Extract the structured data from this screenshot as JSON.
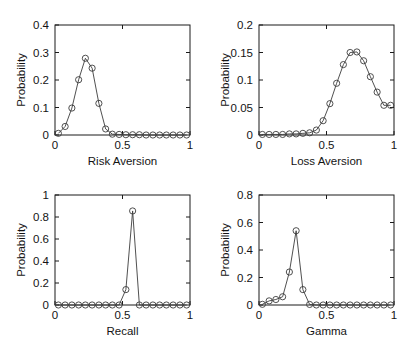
{
  "figure": {
    "layout": "2x2 grid of probability distribution subplots",
    "background_color": "#ffffff",
    "line_color": "#3c3c3c",
    "marker_color": "#3c3c3c",
    "axis_color": "#1a1a1a"
  },
  "chart_data": [
    {
      "id": "risk-aversion",
      "type": "line",
      "title": "",
      "xlabel": "Risk Aversion",
      "ylabel": "Probability",
      "xlim": [
        0,
        1
      ],
      "ylim": [
        0,
        0.4
      ],
      "xticks": [
        0,
        0.5,
        1
      ],
      "xticklabels": [
        "0",
        "0.5",
        "1"
      ],
      "yticks": [
        0,
        0.1,
        0.2,
        0.3,
        0.4
      ],
      "yticklabels": [
        "0",
        "0.1",
        "0.2",
        "0.3",
        "0.4"
      ],
      "grid": false,
      "legend": "none",
      "marker": "open-circle",
      "x": [
        0.025,
        0.075,
        0.125,
        0.175,
        0.225,
        0.275,
        0.325,
        0.375,
        0.425,
        0.475,
        0.525,
        0.575,
        0.625,
        0.675,
        0.725,
        0.775,
        0.825,
        0.875,
        0.925,
        0.975
      ],
      "values": [
        0.006,
        0.031,
        0.098,
        0.201,
        0.279,
        0.243,
        0.115,
        0.022,
        0.003,
        0.002,
        0.001,
        0.001,
        0.001,
        0.0,
        0.0,
        0.0,
        0.0,
        0.0,
        0.0,
        0.0
      ]
    },
    {
      "id": "loss-aversion",
      "type": "line",
      "title": "",
      "xlabel": "Loss Aversion",
      "ylabel": "Probability",
      "xlim": [
        0,
        1
      ],
      "ylim": [
        0,
        0.2
      ],
      "xticks": [
        0,
        0.5,
        1
      ],
      "xticklabels": [
        "0",
        "0.5",
        "1"
      ],
      "yticks": [
        0,
        0.05,
        0.1,
        0.15,
        0.2
      ],
      "yticklabels": [
        "0",
        "0.05",
        "0.1",
        "0.15",
        "0.2"
      ],
      "grid": false,
      "legend": "none",
      "marker": "open-circle",
      "x": [
        0.025,
        0.075,
        0.125,
        0.175,
        0.225,
        0.275,
        0.325,
        0.375,
        0.425,
        0.475,
        0.525,
        0.575,
        0.625,
        0.675,
        0.725,
        0.775,
        0.825,
        0.875,
        0.925,
        0.975
      ],
      "values": [
        0.001,
        0.001,
        0.001,
        0.001,
        0.002,
        0.002,
        0.003,
        0.004,
        0.009,
        0.026,
        0.057,
        0.094,
        0.128,
        0.15,
        0.151,
        0.135,
        0.106,
        0.078,
        0.054,
        0.054
      ]
    },
    {
      "id": "recall",
      "type": "line",
      "title": "",
      "xlabel": "Recall",
      "ylabel": "Probability",
      "xlim": [
        0,
        1
      ],
      "ylim": [
        0,
        1
      ],
      "xticks": [
        0,
        0.5,
        1
      ],
      "xticklabels": [
        "0",
        "0.5",
        "1"
      ],
      "yticks": [
        0,
        0.2,
        0.4,
        0.6,
        0.8,
        1
      ],
      "yticklabels": [
        "0",
        "0.2",
        "0.4",
        "0.6",
        "0.8",
        "1"
      ],
      "grid": false,
      "legend": "none",
      "marker": "open-circle",
      "x": [
        0.025,
        0.075,
        0.125,
        0.175,
        0.225,
        0.275,
        0.325,
        0.375,
        0.425,
        0.475,
        0.525,
        0.575,
        0.625,
        0.675,
        0.725,
        0.775,
        0.825,
        0.875,
        0.925,
        0.975
      ],
      "values": [
        0.0,
        0.0,
        0.0,
        0.0,
        0.0,
        0.0,
        0.0,
        0.0,
        0.0,
        0.0,
        0.14,
        0.855,
        0.0,
        0.0,
        0.0,
        0.0,
        0.0,
        0.0,
        0.0,
        0.0
      ]
    },
    {
      "id": "gamma",
      "type": "line",
      "title": "",
      "xlabel": "Gamma",
      "ylabel": "Probability",
      "xlim": [
        0,
        1
      ],
      "ylim": [
        0,
        0.8
      ],
      "xticks": [
        0,
        0.5,
        1
      ],
      "xticklabels": [
        "0",
        "0.5",
        "1"
      ],
      "yticks": [
        0,
        0.2,
        0.4,
        0.6,
        0.8
      ],
      "yticklabels": [
        "0",
        "0.2",
        "0.4",
        "0.6",
        "0.8"
      ],
      "grid": false,
      "legend": "none",
      "marker": "open-circle",
      "x": [
        0.025,
        0.075,
        0.125,
        0.175,
        0.225,
        0.275,
        0.325,
        0.375,
        0.425,
        0.475,
        0.525,
        0.575,
        0.625,
        0.675,
        0.725,
        0.775,
        0.825,
        0.875,
        0.925,
        0.975
      ],
      "values": [
        0.005,
        0.03,
        0.04,
        0.06,
        0.24,
        0.54,
        0.112,
        0.004,
        0.0,
        0.0,
        0.0,
        0.0,
        0.0,
        0.0,
        0.0,
        0.0,
        0.0,
        0.0,
        0.0,
        0.0
      ]
    }
  ]
}
